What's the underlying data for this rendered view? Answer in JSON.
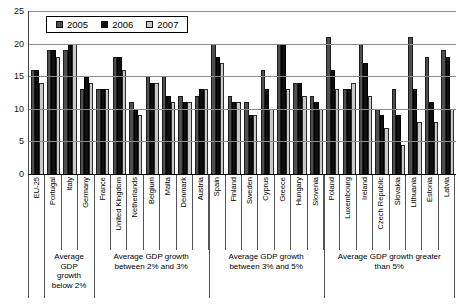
{
  "chart_data": {
    "type": "bar",
    "title": "",
    "xlabel": "",
    "ylabel": "",
    "ylim": [
      0,
      25
    ],
    "yticks": [
      0,
      5,
      10,
      15,
      20,
      25
    ],
    "grid": true,
    "legend_position": "top-left-inside",
    "categories": [
      "EU-25",
      "Portugal",
      "Italy",
      "Germany",
      "France",
      "United Kingdom",
      "Netherlands",
      "Belgium",
      "Malta",
      "Denmark",
      "Austria",
      "Spain",
      "Finland",
      "Sweden",
      "Cyprus",
      "Greece",
      "Hungary",
      "Slovenia",
      "Poland",
      "Luxembourg",
      "Ireland",
      "Czech Republic",
      "Slovakia",
      "Lithuania",
      "Estonia",
      "Latvia"
    ],
    "series": [
      {
        "name": "2005",
        "color": "#4f4f4f",
        "values": [
          16,
          19,
          19,
          13,
          13,
          18,
          11,
          15,
          15,
          12,
          12,
          20,
          12,
          11,
          16,
          20,
          14,
          12,
          21,
          13,
          20,
          10,
          13,
          21,
          18,
          19
        ]
      },
      {
        "name": "2006",
        "color": "#0f0f0f",
        "values": [
          16,
          19,
          20,
          15,
          13,
          18,
          10,
          14,
          12,
          11,
          13,
          18,
          11,
          9,
          13,
          20,
          14,
          11,
          16,
          13,
          17,
          9,
          9,
          13,
          11,
          18
        ]
      },
      {
        "name": "2007",
        "color": "#c9c9c9",
        "values": [
          14,
          18,
          20,
          14,
          13,
          16,
          9,
          14,
          11,
          11,
          13,
          17,
          11,
          9,
          10,
          13,
          12,
          10,
          13,
          14,
          12,
          7,
          4.5,
          8,
          8,
          10
        ]
      }
    ],
    "groups": [
      {
        "label": "",
        "from": 0,
        "to": 0
      },
      {
        "label": "Average GDP growth below 2%",
        "from": 1,
        "to": 3
      },
      {
        "label": "Average GDP growth between 2% and 3%",
        "from": 4,
        "to": 10
      },
      {
        "label": "Average GDP growth between 3% and 5%",
        "from": 11,
        "to": 17
      },
      {
        "label": "Average GDP growth greater than 5%",
        "from": 18,
        "to": 25
      }
    ]
  }
}
